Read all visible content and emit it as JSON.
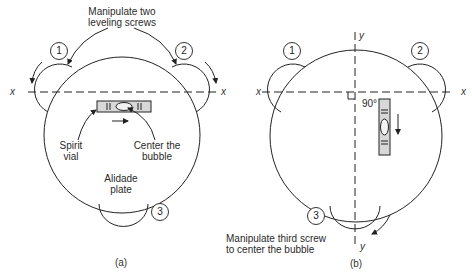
{
  "figure": {
    "panel_a": {
      "caption": "(a)",
      "title_line1": "Manipulate two",
      "title_line2": "leveling screws",
      "screw_labels": [
        "1",
        "2",
        "3"
      ],
      "axis_label_left": "x",
      "axis_label_right": "x",
      "spirit_vial_line1": "Spirit",
      "spirit_vial_line2": "vial",
      "center_bubble_line1": "Center the",
      "center_bubble_line2": "bubble",
      "plate_line1": "Alidade",
      "plate_line2": "plate"
    },
    "panel_b": {
      "caption": "(b)",
      "screw_labels": [
        "1",
        "2",
        "3"
      ],
      "axis_label_left": "x",
      "axis_label_right": "x",
      "axis_label_top": "y",
      "axis_label_bottom": "y",
      "angle_label": "90°",
      "instruction_line1": "Manipulate third screw",
      "instruction_line2": "to center the bubble"
    }
  },
  "colors": {
    "line": "#222222",
    "vial_fill": "#d8d8d8",
    "background": "#ffffff"
  }
}
